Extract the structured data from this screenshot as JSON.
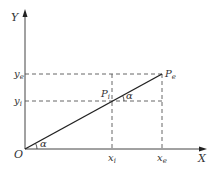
{
  "diagram": {
    "axes": {
      "x_label": "X",
      "y_label": "Y",
      "origin_label": "O"
    },
    "points": {
      "pe": {
        "label": "P",
        "subscript": "e"
      },
      "pi": {
        "label": "P",
        "subscript": "i"
      }
    },
    "ticks": {
      "xi": {
        "label": "x",
        "subscript": "i"
      },
      "xe": {
        "label": "x",
        "subscript": "e"
      },
      "yi": {
        "label": "y",
        "subscript": "i"
      },
      "ye": {
        "label": "y",
        "subscript": "e"
      }
    },
    "angles": {
      "at_origin": "α",
      "at_pi": "α"
    },
    "colors": {
      "line": "#222222",
      "axis": "#444444",
      "dashed": "#555555"
    }
  }
}
